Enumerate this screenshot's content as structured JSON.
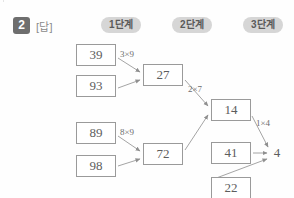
{
  "page": {
    "question_number": "2",
    "answer_tag": "[답]",
    "steps": [
      {
        "label": "1단계"
      },
      {
        "label": "2단계"
      },
      {
        "label": "3단계"
      }
    ],
    "colors": {
      "badge_bg": "#6e6e6e",
      "pill_bg": "#d6d6d6",
      "box_border": "#9a9a9a",
      "text": "#5d5d5d",
      "page_bg": "#fefefe"
    }
  },
  "chart_data": {
    "type": "diagram",
    "title": "",
    "nodes": [
      {
        "id": "n39",
        "value": "39",
        "boxed": true,
        "x": 76,
        "y": 44,
        "w": 40,
        "h": 22
      },
      {
        "id": "n93",
        "value": "93",
        "boxed": true,
        "x": 76,
        "y": 75,
        "w": 40,
        "h": 22
      },
      {
        "id": "n89",
        "value": "89",
        "boxed": true,
        "x": 76,
        "y": 122,
        "w": 40,
        "h": 22
      },
      {
        "id": "n98",
        "value": "98",
        "boxed": true,
        "x": 76,
        "y": 155,
        "w": 40,
        "h": 22
      },
      {
        "id": "n27",
        "value": "27",
        "boxed": true,
        "x": 143,
        "y": 64,
        "w": 40,
        "h": 22
      },
      {
        "id": "n72",
        "value": "72",
        "boxed": true,
        "x": 143,
        "y": 143,
        "w": 40,
        "h": 22
      },
      {
        "id": "n14",
        "value": "14",
        "boxed": true,
        "x": 211,
        "y": 99,
        "w": 40,
        "h": 22
      },
      {
        "id": "n41",
        "value": "41",
        "boxed": true,
        "x": 211,
        "y": 142,
        "w": 40,
        "h": 22
      },
      {
        "id": "n22",
        "value": "22",
        "boxed": true,
        "x": 211,
        "y": 177,
        "w": 40,
        "h": 22
      },
      {
        "id": "n4",
        "value": "4",
        "boxed": false,
        "x": 270,
        "y": 145,
        "w": 14,
        "h": 16
      }
    ],
    "edges": [
      {
        "from": "n39",
        "to": "n27",
        "label": "3×9",
        "label_x": 120,
        "label_y": 49
      },
      {
        "from": "n93",
        "to": "n27",
        "label": "",
        "label_x": 0,
        "label_y": 0
      },
      {
        "from": "n89",
        "to": "n72",
        "label": "8×9",
        "label_x": 120,
        "label_y": 127
      },
      {
        "from": "n98",
        "to": "n72",
        "label": "",
        "label_x": 0,
        "label_y": 0
      },
      {
        "from": "n27",
        "to": "n14",
        "label": "2×7",
        "label_x": 188,
        "label_y": 84
      },
      {
        "from": "n72",
        "to": "n14",
        "label": "",
        "label_x": 0,
        "label_y": 0
      },
      {
        "from": "n14",
        "to": "n4",
        "label": "1×4",
        "label_x": 256,
        "label_y": 118
      },
      {
        "from": "n41",
        "to": "n4",
        "label": "",
        "label_x": 0,
        "label_y": 0
      },
      {
        "from": "n22",
        "to": "n4",
        "label": "",
        "label_x": 0,
        "label_y": 0
      }
    ],
    "edge_paths": [
      {
        "name": "edge-39-27",
        "x1": 118,
        "y1": 58,
        "x2": 140,
        "y2": 72
      },
      {
        "name": "edge-93-27",
        "x1": 118,
        "y1": 88,
        "x2": 140,
        "y2": 80
      },
      {
        "name": "edge-89-72",
        "x1": 118,
        "y1": 136,
        "x2": 140,
        "y2": 151
      },
      {
        "name": "edge-98-72",
        "x1": 118,
        "y1": 166,
        "x2": 140,
        "y2": 159
      },
      {
        "name": "edge-27-14",
        "x1": 185,
        "y1": 80,
        "x2": 208,
        "y2": 106
      },
      {
        "name": "edge-72-14",
        "x1": 185,
        "y1": 150,
        "x2": 208,
        "y2": 115
      },
      {
        "name": "edge-14-4",
        "x1": 252,
        "y1": 116,
        "x2": 268,
        "y2": 147
      },
      {
        "name": "edge-41-4",
        "x1": 253,
        "y1": 153,
        "x2": 267,
        "y2": 153
      },
      {
        "name": "edge-22-4",
        "x1": 211,
        "y1": 180,
        "x2": 267,
        "y2": 159
      }
    ]
  }
}
